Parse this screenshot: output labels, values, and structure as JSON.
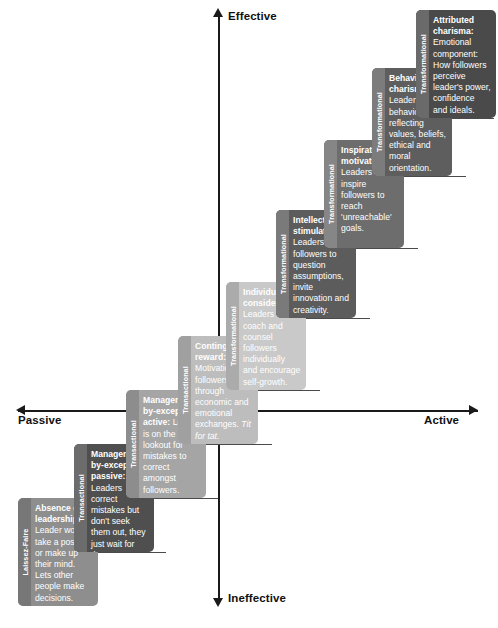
{
  "diagram": {
    "axes": {
      "vertical_top": "Effective",
      "vertical_bottom": "Ineffective",
      "horizontal_left": "Passive",
      "horizontal_right": "Active"
    },
    "categories": {
      "laissez_faire": "Laissez-Faire",
      "transactional": "Transactional",
      "transformational": "Transformational"
    },
    "caption": ""
  },
  "steps": [
    {
      "id": "absence-of-leadership",
      "category": "Laissez-Faire",
      "heading": "Absence of leadership:",
      "body": "Leader won't take a position or make up their mind. Lets other people make decisions.",
      "emphasis": "",
      "box_color": "#8e8e8e",
      "tab_color": "#777777",
      "x": 18,
      "y": 498,
      "height": 108
    },
    {
      "id": "management-by-exception-passive",
      "category": "Transactional",
      "heading": "Management -by-exception passive:",
      "body": "Leaders correct mistakes but don't seek them out, they just wait for them to happen.",
      "emphasis": "",
      "box_color": "#4f4f4f",
      "tab_color": "#6c6c6c",
      "x": 74,
      "y": 444,
      "height": 108
    },
    {
      "id": "management-by-exception-active",
      "category": "Transactional",
      "heading": "Management -by-exception active:",
      "body": "Leader is on the lookout for mistakes to correct amongst followers.",
      "emphasis": "",
      "box_color": "#a5a5a5",
      "tab_color": "#8d8d8d",
      "x": 126,
      "y": 390,
      "height": 108
    },
    {
      "id": "contingent-reward",
      "category": "Transactional",
      "heading": "Contingent reward:",
      "body": "Motivation of followers through economic and emotional exchanges.",
      "emphasis": "Tit for tat.",
      "box_color": "#bdbdbd",
      "tab_color": "#a0a0a0",
      "x": 178,
      "y": 336,
      "height": 108
    },
    {
      "id": "individualized-consideration",
      "category": "Transformational",
      "heading": "Individualized consideration:",
      "body": "Leaders who coach and counsel followers individually and encourage self-growth.",
      "emphasis": "",
      "box_color": "#c9c9c9",
      "tab_color": "#ababab",
      "x": 226,
      "y": 282,
      "height": 108
    },
    {
      "id": "intellectual-stimulation",
      "category": "Transformational",
      "heading": "Intellectual stimulation:",
      "body": "Leaders guide followers to question assumptions, invite innovation and creativity.",
      "emphasis": "",
      "box_color": "#5c5c5c",
      "tab_color": "#7a7a7a",
      "x": 276,
      "y": 210,
      "height": 108
    },
    {
      "id": "inspirational-motivation",
      "category": "Transformational",
      "heading": "Inspirational motivation:",
      "body": "Leaders who inspire followers to reach 'unreachable' goals.",
      "emphasis": "",
      "box_color": "#6d6d6d",
      "tab_color": "#868686",
      "x": 324,
      "y": 140,
      "height": 108
    },
    {
      "id": "behavioural-charisma",
      "category": "Transformational",
      "heading": "Behavioural charisma:",
      "body": "Leader behaviours reflecting values, beliefs, ethical and moral orientation.",
      "emphasis": "",
      "box_color": "#5e5e5e",
      "tab_color": "#7c7c7c",
      "x": 372,
      "y": 68,
      "height": 108
    },
    {
      "id": "attributed-charisma",
      "category": "Transformational",
      "heading": "Attributed charisma:",
      "body": "Emotional component: How followers perceive leader's power, confidence and ideals.",
      "emphasis": "",
      "box_color": "#4a4a4a",
      "tab_color": "#6a6a6a",
      "x": 416,
      "y": 10,
      "height": 108
    }
  ],
  "step_lines": [
    {
      "x": 96,
      "y": 552,
      "w": 70
    },
    {
      "x": 148,
      "y": 498,
      "w": 70
    },
    {
      "x": 200,
      "y": 444,
      "w": 72
    },
    {
      "x": 248,
      "y": 390,
      "w": 72
    },
    {
      "x": 298,
      "y": 318,
      "w": 72
    },
    {
      "x": 346,
      "y": 248,
      "w": 72
    },
    {
      "x": 394,
      "y": 176,
      "w": 72
    },
    {
      "x": 438,
      "y": 118,
      "w": 56
    }
  ]
}
